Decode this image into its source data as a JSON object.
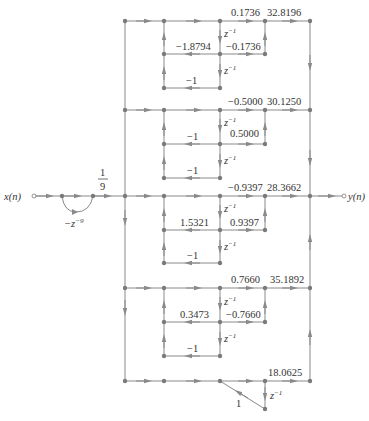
{
  "diagram": {
    "input_label": "x(n)",
    "output_label": "y(n)",
    "comb_gain": "-z^-9",
    "comb_gain_display": "−z",
    "comb_gain_exp": "−9",
    "scale_num": "1",
    "scale_den": "9",
    "delay_label": "z",
    "delay_exp": "−1",
    "sections": [
      {
        "name": "section-1",
        "out_coef": "0.1736",
        "gain": "32.8196",
        "feedback_a1": "−1.8794",
        "cross_coef": "−0.1736",
        "feedback_a2": "−1"
      },
      {
        "name": "section-2",
        "out_coef": "−0.5000",
        "gain": "30.1250",
        "feedback_a1": "−1",
        "cross_coef": "0.5000",
        "feedback_a2": "−1"
      },
      {
        "name": "section-3",
        "out_coef": "−0.9397",
        "gain": "28.3662",
        "feedback_a1": "1.5321",
        "cross_coef": "0.9397",
        "feedback_a2": "−1"
      },
      {
        "name": "section-4",
        "out_coef": "0.7660",
        "gain": "35.1892",
        "feedback_a1": "0.3473",
        "cross_coef": "−0.7660",
        "feedback_a2": "−1"
      },
      {
        "name": "section-5",
        "gain": "18.0625",
        "feedback_coef": "1"
      }
    ]
  }
}
